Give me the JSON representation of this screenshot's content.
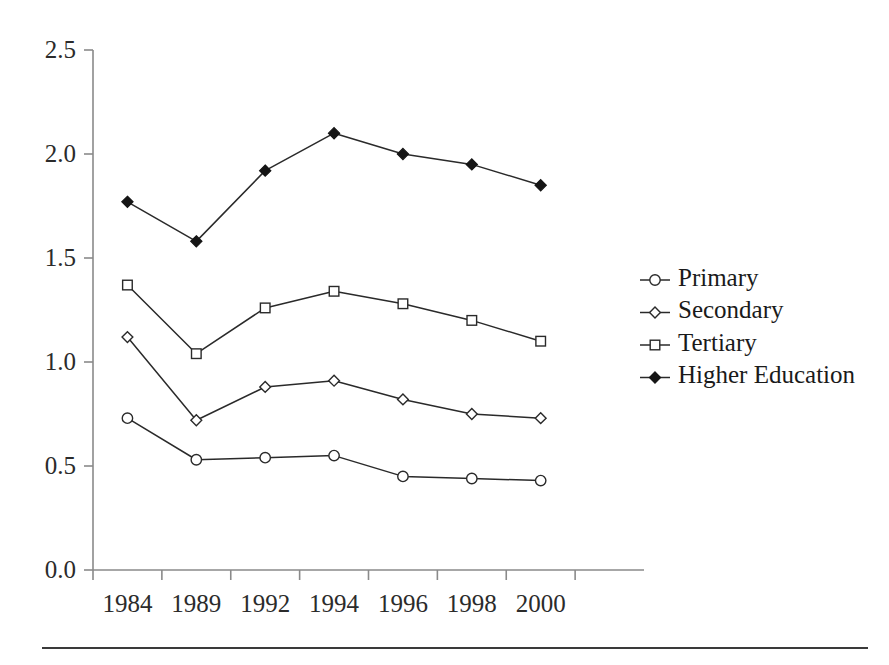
{
  "figure": {
    "background_color": "#ffffff",
    "line_color": "#2a2a2a",
    "axis_color": "#8a8a8a",
    "rule_color": "#3a3a3a"
  },
  "axes": {
    "y_ticks": [
      "0.0",
      "0.5",
      "1.0",
      "1.5",
      "2.0",
      "2.5"
    ],
    "x_ticks": [
      "1984",
      "1989",
      "1992",
      "1994",
      "1996",
      "1998",
      "2000"
    ]
  },
  "legend": {
    "entries": [
      {
        "label": "Primary",
        "marker": "open-circle"
      },
      {
        "label": "Secondary",
        "marker": "open-diamond"
      },
      {
        "label": "Tertiary",
        "marker": "open-square"
      },
      {
        "label": "Higher Education",
        "marker": "filled-diamond"
      }
    ]
  },
  "chart_data": {
    "type": "line",
    "title": "",
    "subtitle": "",
    "xlabel": "",
    "ylabel": "",
    "categories": [
      "1984",
      "1989",
      "1992",
      "1994",
      "1996",
      "1998",
      "2000"
    ],
    "ylim": [
      0.0,
      2.5
    ],
    "ytick_values": [
      0.0,
      0.5,
      1.0,
      1.5,
      2.0,
      2.5
    ],
    "grid": false,
    "legend_position": "right",
    "series": [
      {
        "name": "Primary",
        "marker": "open-circle",
        "values": [
          0.73,
          0.53,
          0.54,
          0.55,
          0.45,
          0.44,
          0.43
        ]
      },
      {
        "name": "Secondary",
        "marker": "open-diamond",
        "values": [
          1.12,
          0.72,
          0.88,
          0.91,
          0.82,
          0.75,
          0.73
        ]
      },
      {
        "name": "Tertiary",
        "marker": "open-square",
        "values": [
          1.37,
          1.04,
          1.26,
          1.34,
          1.28,
          1.2,
          1.1
        ]
      },
      {
        "name": "Higher Education",
        "marker": "filled-diamond",
        "values": [
          1.77,
          1.58,
          1.92,
          2.1,
          2.0,
          1.95,
          1.85
        ]
      }
    ]
  }
}
